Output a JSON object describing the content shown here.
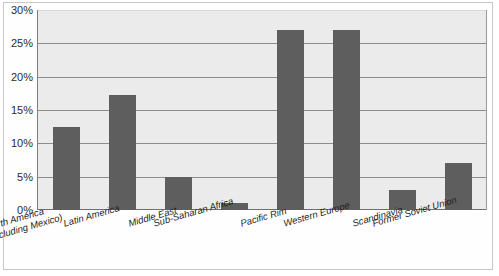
{
  "chart_data": {
    "type": "bar",
    "title": "",
    "subtitle": "",
    "xlabel": "",
    "ylabel": "",
    "ylim": [
      0,
      30
    ],
    "ytick_step": 5,
    "ytick_labels": [
      "0%",
      "5%",
      "10%",
      "15%",
      "20%",
      "25%",
      "30%"
    ],
    "ytick_values": [
      0,
      5,
      10,
      15,
      20,
      25,
      30
    ],
    "grid": true,
    "legend": "none",
    "unit": "%",
    "categories": [
      "North America (including Mexico)",
      "Latin America",
      "Middle East",
      "Sub-Saharan Africa",
      "Pacific Rim",
      "Western Europe",
      "Scandinavia",
      "Former Soviet Union"
    ],
    "category_lines": [
      [
        "North America",
        "(including Mexico)"
      ],
      [
        "Latin America"
      ],
      [
        "Middle East"
      ],
      [
        "Sub-Saharan Africa"
      ],
      [
        "Pacific Rim"
      ],
      [
        "Western Europe"
      ],
      [
        "Scandinavia"
      ],
      [
        "Former Soviet Union"
      ]
    ],
    "values": [
      12.5,
      17.3,
      5,
      1,
      27,
      27,
      3,
      7
    ],
    "bar_color": "#5e5e5e",
    "plot_background": "#ebebeb",
    "grid_color": "#8d8d8d",
    "axis_color": "#6f6f6f",
    "frame_color": "#c9c9c9"
  }
}
